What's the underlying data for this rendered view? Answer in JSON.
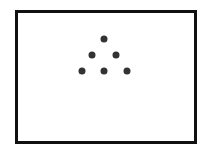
{
  "card": {
    "border_color": "#111111",
    "background": "#ffffff",
    "dot_color": "#333333",
    "dot_count": 6,
    "arrangement": "triangle",
    "dots": [
      {
        "x": 104,
        "y": 39
      },
      {
        "x": 92,
        "y": 55
      },
      {
        "x": 116,
        "y": 55
      },
      {
        "x": 82,
        "y": 71
      },
      {
        "x": 104,
        "y": 71
      },
      {
        "x": 127,
        "y": 71
      }
    ]
  }
}
